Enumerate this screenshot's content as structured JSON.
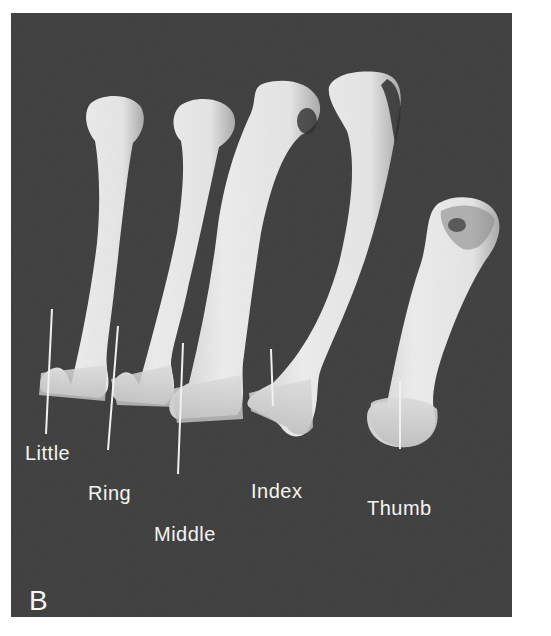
{
  "figure": {
    "panel_letter": "B",
    "background_color": "#3e3e3e",
    "bone_color": "#e2e2e2",
    "label_color": "#f4f4f4",
    "labels": [
      {
        "id": "little",
        "text": "Little"
      },
      {
        "id": "ring",
        "text": "Ring"
      },
      {
        "id": "middle",
        "text": "Middle"
      },
      {
        "id": "index",
        "text": "Index"
      },
      {
        "id": "thumb",
        "text": "Thumb"
      }
    ]
  }
}
